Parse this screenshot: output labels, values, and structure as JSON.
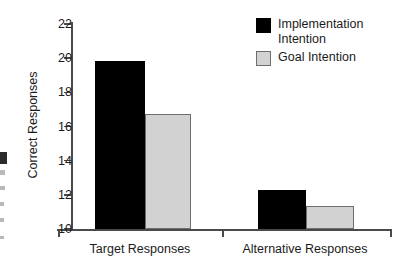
{
  "chart_data": {
    "type": "bar",
    "title": "",
    "xlabel": "",
    "ylabel": "Correct Responses",
    "categories": [
      "Target Responses",
      "Alternative Responses"
    ],
    "series": [
      {
        "name": "Implementation\nIntention",
        "legend_label": "Implementation\nIntention",
        "color": "#000000",
        "values": [
          19.85,
          12.3
        ]
      },
      {
        "name": "Goal Intention",
        "legend_label": "Goal Intention",
        "color": "#d2d2d2",
        "values": [
          16.75,
          11.35
        ]
      }
    ],
    "ylim": [
      10,
      22
    ],
    "yticks": [
      10,
      12,
      14,
      16,
      18,
      20,
      22
    ],
    "ytick_labels": [
      "10",
      "12",
      "14",
      "16",
      "18",
      "20",
      "22"
    ],
    "grid": false,
    "legend_position": "top-right"
  },
  "axis": {
    "y_title": "Correct Responses",
    "ticks": [
      "22",
      "20",
      "18",
      "16",
      "14",
      "12",
      "10"
    ]
  },
  "groups": [
    {
      "label": "Target Responses"
    },
    {
      "label": "Alternative Responses"
    }
  ],
  "legend": {
    "entries": [
      {
        "label": "Implementation\nIntention"
      },
      {
        "label": "Goal Intention"
      }
    ]
  }
}
